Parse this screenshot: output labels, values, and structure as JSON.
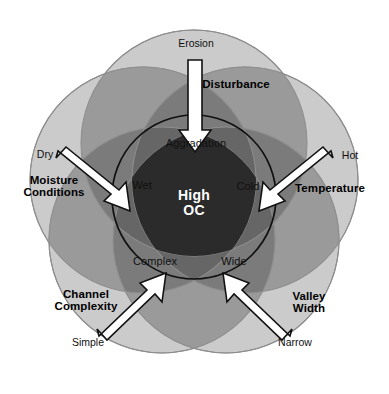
{
  "diagram": {
    "center": {
      "label": "High\nOC",
      "text_color": "#ffffff",
      "fill": "#2b2b2b"
    },
    "inner_labels": [
      {
        "id": "aggradation",
        "text": "Aggradation",
        "x": 196,
        "y": 144
      },
      {
        "id": "wet",
        "text": "Wet",
        "x": 142,
        "y": 186
      },
      {
        "id": "cold",
        "text": "Cold",
        "x": 248,
        "y": 187
      },
      {
        "id": "complex",
        "text": "Complex",
        "x": 155,
        "y": 262
      },
      {
        "id": "wide",
        "text": "Wide",
        "x": 234,
        "y": 262
      }
    ],
    "factors": [
      {
        "id": "disturbance",
        "category": "Disturbance",
        "tip": "Erosion",
        "category_x": 236,
        "category_y": 84,
        "tip_x": 196,
        "tip_y": 44
      },
      {
        "id": "moisture-conditions",
        "category": "Moisture\nConditions",
        "tip": "Dry",
        "category_x": 54,
        "category_y": 186,
        "tip_x": 45,
        "tip_y": 155
      },
      {
        "id": "temperature",
        "category": "Temperature",
        "tip": "Hot",
        "category_x": 330,
        "category_y": 188,
        "tip_x": 350,
        "tip_y": 156
      },
      {
        "id": "channel-complexity",
        "category": "Channel\nComplexity",
        "tip": "Simple",
        "category_x": 86,
        "category_y": 300,
        "tip_x": 88,
        "tip_y": 343
      },
      {
        "id": "valley-width",
        "category": "Valley\nWidth",
        "tip": "Narrow",
        "category_x": 309,
        "category_y": 302,
        "tip_x": 295,
        "tip_y": 343
      }
    ],
    "colors": {
      "outer_circle_fill": "#cbcbcb",
      "mid_overlap_fill": "#9a9a9a",
      "deep_overlap_fill": "#7b7b7b",
      "core_fill": "#2b2b2b",
      "circle_stroke": "#8e8e8e",
      "inner_circle_stroke": "#111111",
      "arrow_fill": "#ffffff",
      "arrow_stroke": "#111111",
      "background": "#ffffff"
    }
  }
}
